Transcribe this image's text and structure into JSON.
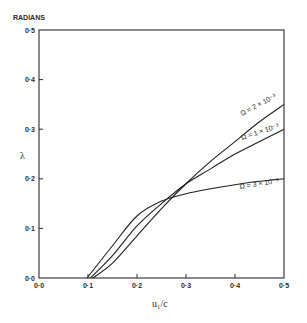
{
  "chart_data": {
    "type": "line",
    "title": "",
    "xlabel": "u₁/c",
    "ylabel": "λ",
    "y_unit": "RADIANS",
    "xlim": [
      0.0,
      0.5
    ],
    "ylim": [
      0.0,
      0.5
    ],
    "grid": false,
    "legend": "inline labels at right end of curves",
    "x_ticks": [
      "0·0",
      "0·1",
      "0·2",
      "0·3",
      "0·4",
      "0·5"
    ],
    "y_ticks": [
      "0·0",
      "0·1",
      "0·2",
      "0·3",
      "0·4",
      "0·5"
    ],
    "series": [
      {
        "name": "Ω = 2 × 10⁻³",
        "x": [
          0.11,
          0.15,
          0.2,
          0.25,
          0.3,
          0.35,
          0.4,
          0.45,
          0.5
        ],
        "y": [
          0.0,
          0.03,
          0.085,
          0.14,
          0.19,
          0.235,
          0.275,
          0.315,
          0.35
        ]
      },
      {
        "name": "Ω = 1 × 10⁻³",
        "x": [
          0.105,
          0.15,
          0.2,
          0.25,
          0.3,
          0.35,
          0.4,
          0.45,
          0.5
        ],
        "y": [
          0.0,
          0.045,
          0.105,
          0.15,
          0.19,
          0.22,
          0.25,
          0.275,
          0.3
        ]
      },
      {
        "name": "Ω = 3 × 10⁻³",
        "x": [
          0.098,
          0.15,
          0.2,
          0.25,
          0.3,
          0.35,
          0.4,
          0.45,
          0.5
        ],
        "y": [
          0.0,
          0.065,
          0.125,
          0.155,
          0.17,
          0.18,
          0.188,
          0.195,
          0.2
        ]
      }
    ]
  },
  "labels": {
    "y_unit": "RADIANS",
    "y_axis": "λ",
    "x_axis": "u₁/c",
    "curve_1": "Ω = 2 × 10⁻³",
    "curve_2": "Ω = 1 × 10⁻³",
    "curve_3": "Ω = 3 × 10⁻³"
  }
}
